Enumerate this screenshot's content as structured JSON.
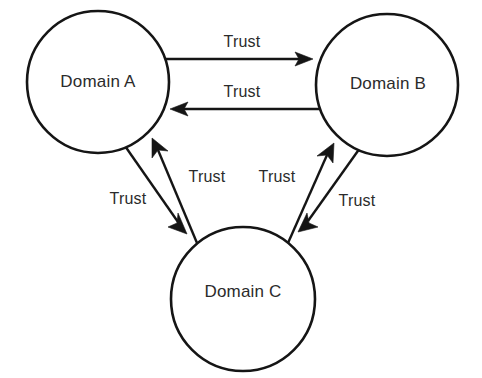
{
  "diagram": {
    "type": "node-link",
    "background_color": "#ffffff",
    "stroke_color": "#151515",
    "text_color": "#2b2b2b",
    "nodes": [
      {
        "id": "A",
        "label": "Domain A",
        "cx": 98,
        "cy": 82,
        "r": 71
      },
      {
        "id": "B",
        "label": "Domain B",
        "cx": 387,
        "cy": 85,
        "r": 71
      },
      {
        "id": "C",
        "label": "Domain C",
        "cx": 243,
        "cy": 299,
        "r": 72
      }
    ],
    "edges": [
      {
        "id": "a-to-b",
        "from": "A",
        "to": "B",
        "label": "Trust",
        "label_x": 242,
        "label_y": 43
      },
      {
        "id": "b-to-a",
        "from": "B",
        "to": "A",
        "label": "Trust",
        "label_x": 242,
        "label_y": 93
      },
      {
        "id": "a-to-c",
        "from": "A",
        "to": "C",
        "label": "Trust",
        "label_x": 128,
        "label_y": 200
      },
      {
        "id": "c-to-a",
        "from": "C",
        "to": "A",
        "label": "Trust",
        "label_x": 207,
        "label_y": 178
      },
      {
        "id": "c-to-b",
        "from": "C",
        "to": "B",
        "label": "Trust",
        "label_x": 277,
        "label_y": 178
      },
      {
        "id": "b-to-c",
        "from": "B",
        "to": "C",
        "label": "Trust",
        "label_x": 357,
        "label_y": 202
      }
    ]
  }
}
